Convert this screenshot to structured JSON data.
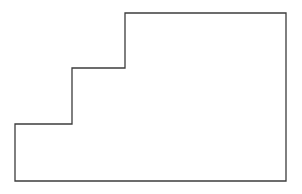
{
  "figure": {
    "name": "staircase-polygon",
    "background_color": "#ffffff",
    "stroke_color": "#3c3c3c",
    "fill_color": "#ffffff",
    "stroke_width": 1.3,
    "canvas": {
      "width": 302,
      "height": 194
    },
    "vertices": [
      {
        "label": "top-left-of-upper-tier",
        "x": 125,
        "y": 13
      },
      {
        "label": "top-right",
        "x": 286,
        "y": 13
      },
      {
        "label": "bottom-right",
        "x": 286,
        "y": 181
      },
      {
        "label": "bottom-left",
        "x": 15,
        "y": 181
      },
      {
        "label": "lower-step-left",
        "x": 15,
        "y": 124
      },
      {
        "label": "lower-step-right",
        "x": 72,
        "y": 124
      },
      {
        "label": "middle-step-left",
        "x": 72,
        "y": 68
      },
      {
        "label": "middle-step-right",
        "x": 125,
        "y": 68
      }
    ],
    "path": "M 125 13 L 286 13 L 286 181 L 15 181 L 15 124 L 72 124 L 72 68 L 125 68 Z",
    "edges": [
      {
        "name": "top-edge",
        "orientation": "horizontal",
        "from": [
          125,
          13
        ],
        "to": [
          286,
          13
        ]
      },
      {
        "name": "right-edge",
        "orientation": "vertical",
        "from": [
          286,
          13
        ],
        "to": [
          286,
          181
        ]
      },
      {
        "name": "bottom-edge",
        "orientation": "horizontal",
        "from": [
          286,
          181
        ],
        "to": [
          15,
          181
        ]
      },
      {
        "name": "left-edge",
        "orientation": "vertical",
        "from": [
          15,
          181
        ],
        "to": [
          15,
          124
        ]
      },
      {
        "name": "lower-step-tread",
        "orientation": "horizontal",
        "from": [
          15,
          124
        ],
        "to": [
          72,
          124
        ]
      },
      {
        "name": "lower-step-riser",
        "orientation": "vertical",
        "from": [
          72,
          124
        ],
        "to": [
          72,
          68
        ]
      },
      {
        "name": "upper-step-tread",
        "orientation": "horizontal",
        "from": [
          72,
          68
        ],
        "to": [
          125,
          68
        ]
      },
      {
        "name": "upper-step-riser",
        "orientation": "vertical",
        "from": [
          125,
          68
        ],
        "to": [
          125,
          13
        ]
      }
    ]
  }
}
